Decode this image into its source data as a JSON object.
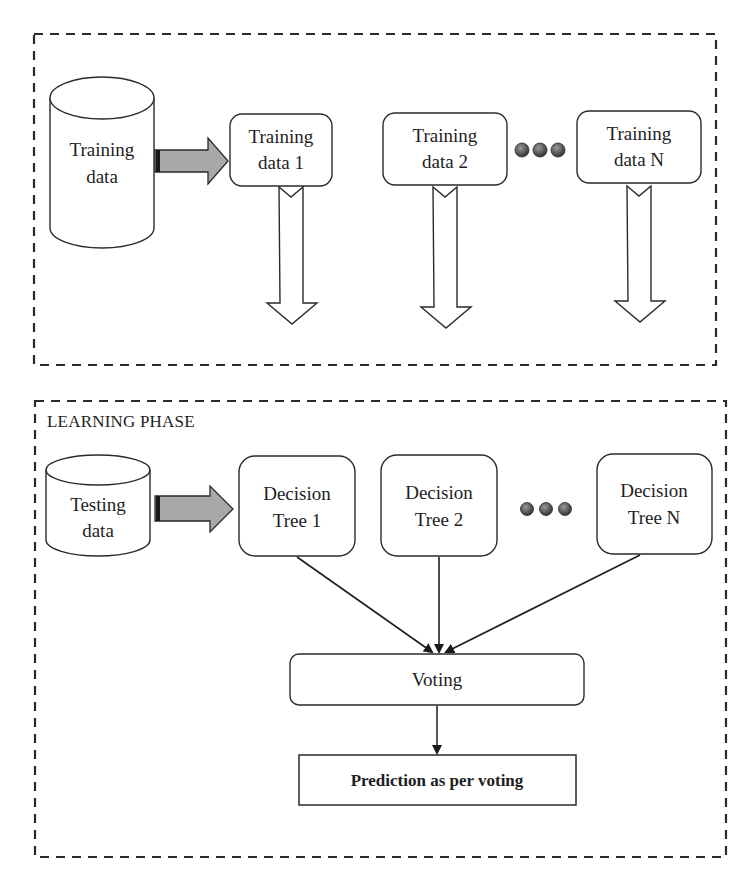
{
  "colors": {
    "stroke": "#2a2a2a",
    "gray_arrow": "#a8a8a8",
    "dot": "#555555",
    "background": "#ffffff"
  },
  "top_section": {
    "source": {
      "icon": "database-cylinder-icon",
      "line1": "Training",
      "line2": "data"
    },
    "subsets": [
      {
        "line1": "Training",
        "line2": "data 1"
      },
      {
        "line1": "Training",
        "line2": "data 2"
      },
      {
        "line1": "Training",
        "line2": "data N"
      }
    ],
    "ellipsis_icon": "three-dots-icon"
  },
  "bottom_section": {
    "phase_label": "LEARNING PHASE",
    "source": {
      "icon": "database-cylinder-icon",
      "line1": "Testing",
      "line2": "data"
    },
    "trees": [
      {
        "line1": "Decision",
        "line2": "Tree 1"
      },
      {
        "line1": "Decision",
        "line2": "Tree 2"
      },
      {
        "line1": "Decision",
        "line2": "Tree N"
      }
    ],
    "ellipsis_icon": "three-dots-icon",
    "voting_label": "Voting",
    "prediction_label": "Prediction as per voting"
  }
}
